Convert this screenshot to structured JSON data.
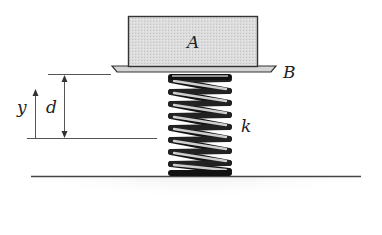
{
  "diagram": {
    "type": "mechanics-spring-mass",
    "labels": {
      "block": "A",
      "platform": "B",
      "spring_constant": "k",
      "displacement": "d",
      "coordinate": "y"
    },
    "colors": {
      "block_fill": "#d9d9d9",
      "outline": "#333333",
      "spring_dark": "#111111",
      "spring_light": "#bdbdbd",
      "ground_shade": "#cfcfcf",
      "line": "#555555"
    }
  }
}
